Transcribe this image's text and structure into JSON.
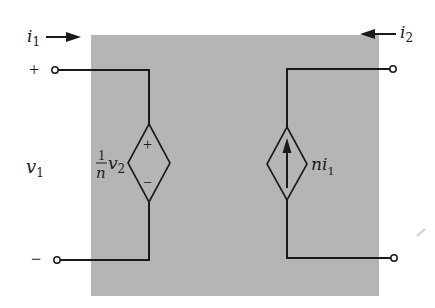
{
  "diagram": {
    "type": "two-port circuit (ideal transformer model with dependent sources)",
    "colors": {
      "box_fill": "#b5b5b5",
      "wire": "#1a1a1a",
      "background": "#ffffff"
    },
    "labels": {
      "i1_base": "i",
      "i1_sub": "1",
      "i2_base": "i",
      "i2_sub": "2",
      "v1_base": "v",
      "v1_sub": "1",
      "port1_plus": "+",
      "port1_minus": "−",
      "left_source_numer": "1",
      "left_source_denom": "n",
      "left_source_var": "v",
      "left_source_sub": "2",
      "left_source_plus": "+",
      "left_source_minus": "−",
      "right_source_coef": "n",
      "right_source_var": "i",
      "right_source_sub": "1"
    },
    "components": [
      {
        "name": "dependent-voltage-source",
        "value": "(1/n) v2",
        "position": "left"
      },
      {
        "name": "dependent-current-source",
        "value": "n i1",
        "position": "right",
        "direction": "up"
      }
    ]
  }
}
